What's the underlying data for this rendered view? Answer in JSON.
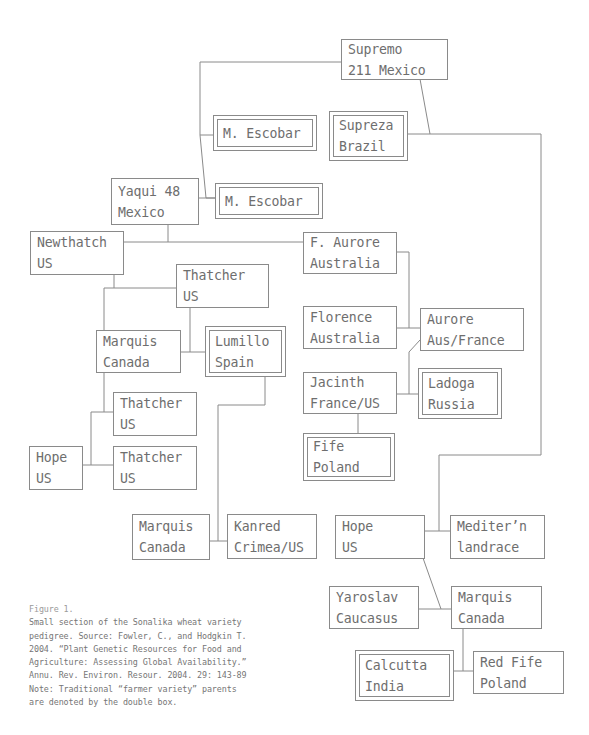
{
  "figure": {
    "title": "Figure 1.",
    "caption_lines": [
      "Small section of the Sonalika wheat variety",
      "pedigree. Source: Fowler, C., and Hodgkin T.",
      "2004. “Plant Genetic Resources for Food and",
      "Agriculture: Assessing Global Availability.”",
      "Annu. Rev. Environ. Resour. 2004. 29: 143-89",
      "Note: Traditional “farmer variety” parents",
      "are denoted by the double box."
    ]
  },
  "colors": {
    "line": "#8a8a8a",
    "text": "#6e6e6e",
    "background": "#ffffff"
  },
  "nodes": [
    {
      "id": "supremo",
      "line1": "Supremo",
      "line2": "211 Mexico",
      "double": false
    },
    {
      "id": "m-escobar-1",
      "line1": "M. Escobar",
      "line2": "",
      "double": true
    },
    {
      "id": "supreza",
      "line1": "Supreza",
      "line2": "Brazil",
      "double": true
    },
    {
      "id": "yaqui",
      "line1": "Yaqui 48",
      "line2": "Mexico",
      "double": false
    },
    {
      "id": "m-escobar-2",
      "line1": "M. Escobar",
      "line2": "",
      "double": true
    },
    {
      "id": "newthatch",
      "line1": "Newthatch",
      "line2": "US",
      "double": false
    },
    {
      "id": "f-aurore",
      "line1": "F. Aurore",
      "line2": "Australia",
      "double": false
    },
    {
      "id": "thatcher-top",
      "line1": "Thatcher",
      "line2": "US",
      "double": false
    },
    {
      "id": "florence",
      "line1": "Florence",
      "line2": "Australia",
      "double": false
    },
    {
      "id": "aurore",
      "line1": "Aurore",
      "line2": "Aus/France",
      "double": false
    },
    {
      "id": "marquis-left",
      "line1": "Marquis",
      "line2": "Canada",
      "double": false
    },
    {
      "id": "lumillo",
      "line1": "Lumillo",
      "line2": "Spain",
      "double": true
    },
    {
      "id": "jacinth",
      "line1": "Jacinth",
      "line2": "France/US",
      "double": false
    },
    {
      "id": "ladoga",
      "line1": "Ladoga",
      "line2": "Russia",
      "double": true
    },
    {
      "id": "thatcher-mid",
      "line1": "Thatcher",
      "line2": "US",
      "double": false
    },
    {
      "id": "fife",
      "line1": "Fife",
      "line2": "Poland",
      "double": true
    },
    {
      "id": "hope-left",
      "line1": "Hope",
      "line2": "US",
      "double": false
    },
    {
      "id": "thatcher-low",
      "line1": "Thatcher",
      "line2": "US",
      "double": false
    },
    {
      "id": "marquis-lower",
      "line1": "Marquis",
      "line2": "Canada",
      "double": false
    },
    {
      "id": "kanred",
      "line1": "Kanred",
      "line2": "Crimea/US",
      "double": false
    },
    {
      "id": "hope-right",
      "line1": "Hope",
      "line2": "US",
      "double": false
    },
    {
      "id": "mediterranean",
      "line1": "Mediter’n",
      "line2": "landrace",
      "double": false
    },
    {
      "id": "yaroslav",
      "line1": "Yaroslav",
      "line2": "Caucasus",
      "double": false
    },
    {
      "id": "marquis-right",
      "line1": "Marquis",
      "line2": "Canada",
      "double": false
    },
    {
      "id": "calcutta",
      "line1": "Calcutta",
      "line2": "India",
      "double": true
    },
    {
      "id": "red-fife",
      "line1": "Red Fife",
      "line2": "Poland",
      "double": false
    }
  ]
}
